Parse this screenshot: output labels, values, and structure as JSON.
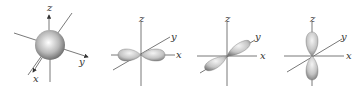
{
  "diagrams": [
    {
      "name": "s-orbital",
      "labels": {
        "x": "x",
        "y": "y",
        "z": "z"
      }
    },
    {
      "name": "px-orbital",
      "labels": {
        "x": "x",
        "y": "y",
        "z": "z"
      }
    },
    {
      "name": "py-orbital",
      "labels": {
        "x": "x",
        "y": "y",
        "z": "z"
      }
    },
    {
      "name": "pz-orbital",
      "labels": {
        "x": "x",
        "y": "y",
        "z": "z"
      }
    }
  ],
  "colors": {
    "axis": "#6a6a6a",
    "lobe_light": "#f2f2f2",
    "lobe_dark": "#7a7a7a"
  }
}
